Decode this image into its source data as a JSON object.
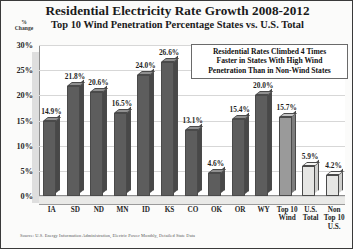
{
  "chart_data": {
    "type": "bar",
    "title": "Residential Electricity Rate Growth 2008-2012",
    "subtitle": "Top 10 Wind Penetration Percentage States vs. U.S. Total",
    "xlabel": "",
    "ylabel": "% Change",
    "ylim": [
      0,
      30
    ],
    "ytick_labels": [
      "30%",
      "25%",
      "20%",
      "15%",
      "10%",
      "5%",
      "0%"
    ],
    "ytick_values": [
      30,
      25,
      20,
      15,
      10,
      5,
      0
    ],
    "grid": true,
    "legend": "none",
    "categories": [
      "IA",
      "SD",
      "ND",
      "MN",
      "ID",
      "KS",
      "CO",
      "OK",
      "OR",
      "WY",
      "Top 10 Wind",
      "U.S. Total",
      "Non Top 10 U.S."
    ],
    "category_lines": [
      [
        "IA"
      ],
      [
        "SD"
      ],
      [
        "ND"
      ],
      [
        "MN"
      ],
      [
        "ID"
      ],
      [
        "KS"
      ],
      [
        "CO"
      ],
      [
        "OK"
      ],
      [
        "OR"
      ],
      [
        "WY"
      ],
      [
        "Top 10",
        "Wind"
      ],
      [
        "U.S.",
        "Total"
      ],
      [
        "Non",
        "Top 10",
        "U.S."
      ]
    ],
    "values": [
      14.9,
      21.8,
      20.6,
      16.5,
      24.0,
      26.6,
      13.1,
      4.6,
      15.4,
      20.0,
      15.7,
      5.9,
      4.2
    ],
    "value_labels": [
      "14.9%",
      "21.8%",
      "20.6%",
      "16.5%",
      "24.0%",
      "26.6%",
      "13.1%",
      "4.6%",
      "15.4%",
      "20.0%",
      "15.7%",
      "5.9%",
      "4.2%"
    ],
    "bar_shades": [
      "dark",
      "dark",
      "dark",
      "dark",
      "dark",
      "dark",
      "dark",
      "dark",
      "dark",
      "dark",
      "mid",
      "light",
      "light"
    ],
    "annotation": {
      "lines": [
        "Residential Rates Climbed 4 Times",
        "Faster in States With High Wind",
        "Penetration Than in Non-Wind States"
      ]
    },
    "source": "Source: U.S. Energy Information Administration, Electric Power Monthly, Detailed State Data",
    "colors": {
      "bar_dark": "#5d5d5d",
      "bar_mid": "#9a9a9a",
      "bar_light": "#e6e6e4",
      "text": "#1a1a1a",
      "grid": "#d7d7d7",
      "frame": "#3a3a3a"
    }
  }
}
